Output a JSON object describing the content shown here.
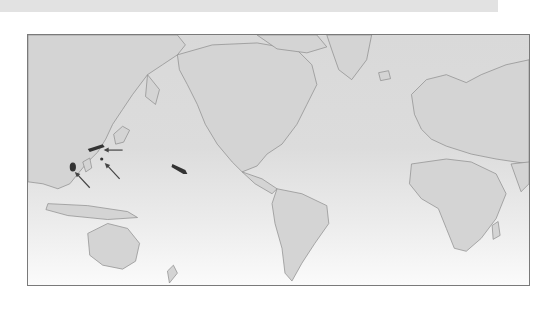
{
  "map": {
    "projection": "Pacific-centered world map",
    "colors": {
      "land": "#d4d4d4",
      "coast": "#8a8a8a",
      "ocean_top": "#d9d9d9",
      "ocean_bottom": "#fbfbfb",
      "frame": "#7a7a7a",
      "marker": "#333333",
      "top_band": "#e2e2e2"
    },
    "markers": [
      {
        "name": "japan-marker",
        "type": "arrow-pointed"
      },
      {
        "name": "western-pacific-dot",
        "type": "arrow-pointed"
      },
      {
        "name": "philippines-marker",
        "type": "arrow-pointed"
      },
      {
        "name": "hawaii-marker",
        "type": "elongated-mark"
      }
    ],
    "arrows": 3
  }
}
